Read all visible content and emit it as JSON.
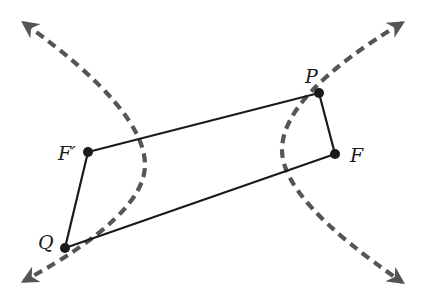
{
  "diagram": {
    "type": "hyperbola-focal-quadrilateral",
    "colors": {
      "line": "#1a1a1a",
      "curve": "#555555",
      "point": "#1a1a1a",
      "background": "#ffffff"
    },
    "points": {
      "F_prime": {
        "label": "F′",
        "x": 88,
        "y": 152
      },
      "P": {
        "label": "P",
        "x": 319,
        "y": 93
      },
      "F": {
        "label": "F",
        "x": 335,
        "y": 154
      },
      "Q": {
        "label": "Q",
        "x": 65,
        "y": 248
      }
    },
    "segments": [
      "F′P",
      "PF",
      "FQ",
      "QF′"
    ],
    "curves": [
      {
        "name": "left-branch",
        "style": "dashed",
        "arrows": "both"
      },
      {
        "name": "right-branch",
        "style": "dashed",
        "arrows": "both"
      }
    ]
  }
}
